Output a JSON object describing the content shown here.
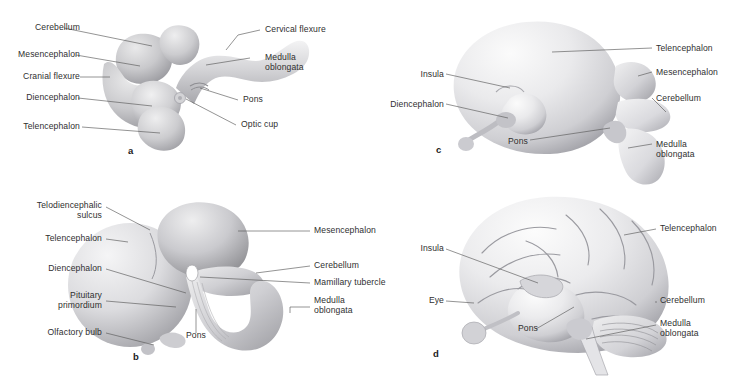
{
  "figure": {
    "background_color": "#ffffff",
    "label_color": "#2f2f2f",
    "leader_color": "#5a5a5a"
  },
  "panels": [
    {
      "id": "a",
      "letter": "a",
      "subject": "embryonic-brain-with-flexures",
      "labels_left": [
        {
          "text": "Cerebellum",
          "name": "label-cerebellum"
        },
        {
          "text": "Mesencephalon",
          "name": "label-mesencephalon"
        },
        {
          "text": "Cranial flexure",
          "name": "label-cranial-flexure"
        },
        {
          "text": "Diencephalon",
          "name": "label-diencephalon"
        },
        {
          "text": "Telencephalon",
          "name": "label-telencephalon"
        }
      ],
      "labels_right": [
        {
          "text": "Cervical flexure",
          "name": "label-cervical-flexure"
        },
        {
          "text": "Medulla\noblongata",
          "name": "label-medulla-oblongata"
        },
        {
          "text": "Pons",
          "name": "label-pons"
        },
        {
          "text": "Optic cup",
          "name": "label-optic-cup"
        }
      ]
    },
    {
      "id": "b",
      "letter": "b",
      "subject": "early-fetal-brain",
      "labels_left": [
        {
          "text": "Telodiencephalic\nsulcus",
          "name": "label-telodiencephalic-sulcus"
        },
        {
          "text": "Telencephalon",
          "name": "label-telencephalon"
        },
        {
          "text": "Diencephalon",
          "name": "label-diencephalon"
        },
        {
          "text": "Pituitary\nprimordium",
          "name": "label-pituitary-primordium"
        },
        {
          "text": "Olfactory bulb",
          "name": "label-olfactory-bulb"
        }
      ],
      "labels_right": [
        {
          "text": "Mesencephalon",
          "name": "label-mesencephalon"
        },
        {
          "text": "Cerebellum",
          "name": "label-cerebellum"
        },
        {
          "text": "Mamillary tubercle",
          "name": "label-mamillary-tubercle"
        },
        {
          "text": "Medulla\noblongata",
          "name": "label-medulla-oblongata"
        }
      ],
      "labels_bottom": [
        {
          "text": "Pons",
          "name": "label-pons"
        }
      ]
    },
    {
      "id": "c",
      "letter": "c",
      "subject": "smooth-fetal-brain",
      "labels_left": [
        {
          "text": "Insula",
          "name": "label-insula"
        },
        {
          "text": "Diencephalon",
          "name": "label-diencephalon"
        }
      ],
      "labels_right": [
        {
          "text": "Telencephalon",
          "name": "label-telencephalon"
        },
        {
          "text": "Mesencephalon",
          "name": "label-mesencephalon"
        },
        {
          "text": "Cerebellum",
          "name": "label-cerebellum"
        },
        {
          "text": "Medulla\noblongata",
          "name": "label-medulla-oblongata"
        }
      ],
      "labels_bottom": [
        {
          "text": "Pons",
          "name": "label-pons"
        }
      ]
    },
    {
      "id": "d",
      "letter": "d",
      "subject": "gyrified-mature-brain",
      "labels_left": [
        {
          "text": "Insula",
          "name": "label-insula"
        },
        {
          "text": "Eye",
          "name": "label-eye"
        }
      ],
      "labels_right": [
        {
          "text": "Telencephalon",
          "name": "label-telencephalon"
        },
        {
          "text": "Cerebellum",
          "name": "label-cerebellum"
        },
        {
          "text": "Medulla\noblongata",
          "name": "label-medulla-oblongata"
        }
      ],
      "labels_bottom": [
        {
          "text": "Pons",
          "name": "label-pons"
        }
      ]
    }
  ]
}
